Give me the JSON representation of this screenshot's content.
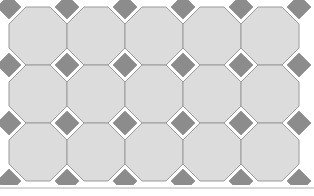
{
  "figure": {
    "kind": "geometric-tiling",
    "width": 314,
    "height": 196,
    "background_color": "#ffffff"
  },
  "palette": {
    "octagon_fill": "#dcdcdc",
    "octagon_stroke": "#9a9a9a",
    "square_fill": "#8c8c8c",
    "square_stroke": "#9a9a9a",
    "rule_color": "#b0b0b0",
    "background": "#ffffff"
  },
  "geometry": {
    "period": 58,
    "octagon_side": 24,
    "octagon_cut": 17,
    "stroke_width": 1,
    "octagon_centers_x": [
      38,
      96,
      154,
      212,
      270
    ],
    "octagon_centers_y": [
      36,
      94,
      152
    ],
    "square_centers_x": [
      9,
      67,
      125,
      183,
      241,
      299
    ],
    "square_centers_y": [
      7,
      65,
      123,
      181
    ],
    "square_half_diagonal": 12
  },
  "bottom_rule": {
    "y": 188,
    "x_start": 0,
    "x_end": 314,
    "thickness": 1
  },
  "counts": {
    "octagon_rows": 3,
    "octagon_columns": 5,
    "visible_squares": 8
  },
  "labels": {
    "pattern_name": "octagon-and-square tiling",
    "octagon_name": "octagon-tile",
    "square_name": "square-tile"
  }
}
